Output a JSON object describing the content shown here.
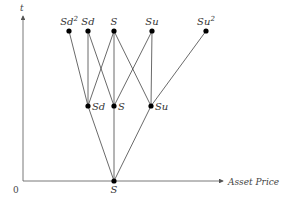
{
  "diagram": {
    "axes": {
      "y_label": "t",
      "x_label": "Asset Price",
      "origin_label": "0",
      "color": "#555555"
    },
    "colors": {
      "edge": "#444444",
      "node": "#000000"
    },
    "nodes": [
      {
        "id": "top-sd2",
        "label": "Sd",
        "sup": "2",
        "x": 69,
        "y": 31,
        "label_pos": "above"
      },
      {
        "id": "top-sd",
        "label": "Sd",
        "sup": "",
        "x": 88,
        "y": 31,
        "label_pos": "above"
      },
      {
        "id": "top-s",
        "label": "S",
        "sup": "",
        "x": 114,
        "y": 31,
        "label_pos": "above"
      },
      {
        "id": "top-su",
        "label": "Su",
        "sup": "",
        "x": 152,
        "y": 31,
        "label_pos": "above"
      },
      {
        "id": "top-su2",
        "label": "Su",
        "sup": "2",
        "x": 206,
        "y": 31,
        "label_pos": "above"
      },
      {
        "id": "mid-sd",
        "label": "Sd",
        "sup": "",
        "x": 88,
        "y": 106,
        "label_pos": "right"
      },
      {
        "id": "mid-s",
        "label": "S",
        "sup": "",
        "x": 114,
        "y": 106,
        "label_pos": "right"
      },
      {
        "id": "mid-su",
        "label": "Su",
        "sup": "",
        "x": 151,
        "y": 106,
        "label_pos": "right"
      },
      {
        "id": "root-s",
        "label": "S",
        "sup": "",
        "x": 114,
        "y": 181,
        "label_pos": "below"
      }
    ],
    "edges": [
      [
        "root-s",
        "mid-sd"
      ],
      [
        "root-s",
        "mid-s"
      ],
      [
        "root-s",
        "mid-su"
      ],
      [
        "mid-sd",
        "top-sd2"
      ],
      [
        "mid-sd",
        "top-sd"
      ],
      [
        "mid-sd",
        "top-s"
      ],
      [
        "mid-s",
        "top-sd"
      ],
      [
        "mid-s",
        "top-s"
      ],
      [
        "mid-s",
        "top-su"
      ],
      [
        "mid-su",
        "top-s"
      ],
      [
        "mid-su",
        "top-su"
      ],
      [
        "mid-su",
        "top-su2"
      ]
    ]
  }
}
